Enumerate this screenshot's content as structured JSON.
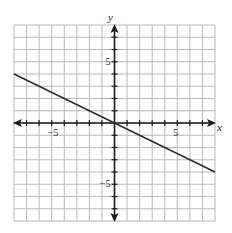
{
  "chart_data": {
    "type": "line",
    "title": "",
    "xlabel": "x",
    "ylabel": "y",
    "xlim": [
      -8,
      8
    ],
    "ylim": [
      -8,
      8
    ],
    "grid": true,
    "grid_step": 1,
    "x_tick_labels": [
      {
        "value": -5,
        "label": "−5"
      },
      {
        "value": 5,
        "label": "5"
      }
    ],
    "y_tick_labels": [
      {
        "value": 5,
        "label": "5"
      },
      {
        "value": -5,
        "label": "−5"
      }
    ],
    "series": [
      {
        "name": "y = -x/2",
        "equation": "y = -1/2 x",
        "slope": -0.5,
        "intercept": 0,
        "points": [
          [
            -8,
            4
          ],
          [
            0,
            0
          ],
          [
            8,
            -4
          ]
        ]
      }
    ],
    "axes_arrows": true,
    "legend": null
  },
  "style": {
    "grid_color": "#b8b8b8",
    "axis_color": "#1a1a1a",
    "line_color": "#2a2a2a"
  }
}
